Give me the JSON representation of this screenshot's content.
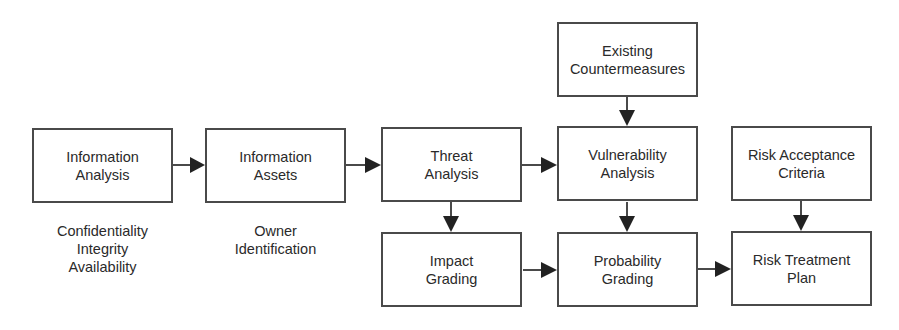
{
  "diagram": {
    "nodes": [
      {
        "id": "info_analysis",
        "lines": [
          "Information",
          "Analysis"
        ]
      },
      {
        "id": "info_assets",
        "lines": [
          "Information",
          "Assets"
        ]
      },
      {
        "id": "threat_analysis",
        "lines": [
          "Threat",
          "Analysis"
        ]
      },
      {
        "id": "existing_countermeasures",
        "lines": [
          "Existing",
          "Countermeasures"
        ]
      },
      {
        "id": "vulnerability_analysis",
        "lines": [
          "Vulnerability",
          "Analysis"
        ]
      },
      {
        "id": "risk_acceptance",
        "lines": [
          "Risk Acceptance",
          "Criteria"
        ]
      },
      {
        "id": "impact_grading",
        "lines": [
          "Impact",
          "Grading"
        ]
      },
      {
        "id": "probability_grading",
        "lines": [
          "Probability",
          "Grading"
        ]
      },
      {
        "id": "risk_treatment",
        "lines": [
          "Risk Treatment",
          "Plan"
        ]
      }
    ],
    "notes": {
      "info_analysis": [
        "Confidentiality",
        "Integrity",
        "Availability"
      ],
      "info_assets": [
        "Owner",
        "Identification"
      ]
    },
    "edges": [
      [
        "info_analysis",
        "info_assets"
      ],
      [
        "info_assets",
        "threat_analysis"
      ],
      [
        "threat_analysis",
        "vulnerability_analysis"
      ],
      [
        "existing_countermeasures",
        "vulnerability_analysis"
      ],
      [
        "threat_analysis",
        "impact_grading"
      ],
      [
        "vulnerability_analysis",
        "probability_grading"
      ],
      [
        "risk_acceptance",
        "risk_treatment"
      ],
      [
        "impact_grading",
        "probability_grading"
      ],
      [
        "probability_grading",
        "risk_treatment"
      ]
    ],
    "colors": {
      "stroke": "#4a4a4a",
      "arrowhead": "#222222",
      "text": "#2a2a2a"
    }
  }
}
